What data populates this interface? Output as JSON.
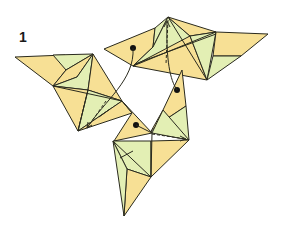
{
  "diagram": {
    "step_number": "1",
    "colors": {
      "paper_front": "#f7e095",
      "paper_back": "#e3efb4",
      "lines": "#2a2a1e",
      "background": "#ffffff"
    },
    "units": [
      {
        "name": "left-unit"
      },
      {
        "name": "top-unit"
      },
      {
        "name": "bottom-unit"
      }
    ],
    "arrows": [
      {
        "name": "arrow-top-to-left",
        "from": "top-unit flap",
        "to": "left-unit pocket"
      },
      {
        "name": "arrow-bottom-to-top",
        "from": "bottom-unit flap",
        "to": "top-unit pocket"
      },
      {
        "name": "arrow-left-to-bottom",
        "from": "left-unit flap",
        "to": "bottom-unit pocket"
      }
    ]
  }
}
